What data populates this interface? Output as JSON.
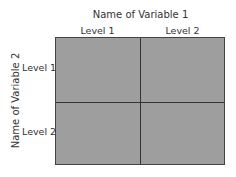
{
  "diagram": {
    "x_title": "Name of Variable 1",
    "y_title": "Name of Variable 2",
    "columns": [
      "Level 1",
      "Level 2"
    ],
    "rows": [
      "Level 1",
      "Level 2"
    ],
    "cell_color": "#9e9e9e"
  }
}
